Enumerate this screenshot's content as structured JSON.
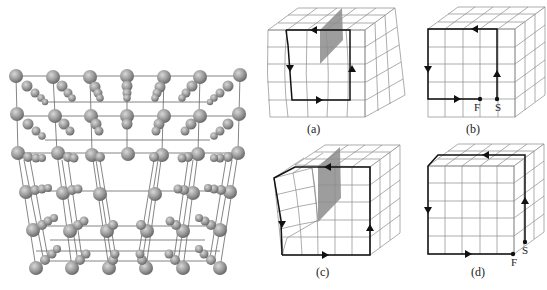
{
  "figure": {
    "lattice_model": {
      "description": "3D ball-and-stick crystal lattice with extra half-plane (edge dislocation)",
      "atom_color": "#9a9a9a",
      "bond_color": "#555555"
    },
    "panels": [
      {
        "id": "a",
        "label": "(a)",
        "description": "Distorted lattice with extra half-plane, closed circuit"
      },
      {
        "id": "b",
        "label": "(b)",
        "description": "Perfect lattice, open circuit",
        "points": [
          "F",
          "S"
        ]
      },
      {
        "id": "c",
        "label": "(c)",
        "description": "Distorted lattice with extra half-plane, closed circuit"
      },
      {
        "id": "d",
        "label": "(d)",
        "description": "Perfect lattice, open circuit",
        "points": [
          "F",
          "S"
        ]
      }
    ],
    "colors": {
      "grid": "#888888",
      "circuit": "#111111",
      "half_plane": "#8c8c8c"
    }
  }
}
